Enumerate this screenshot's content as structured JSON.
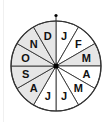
{
  "wheel": {
    "title": "Month wheel",
    "center": [
      56,
      66
    ],
    "radius": 45,
    "shade_color": "#e6e6e6",
    "line_color": "#333333",
    "segments": [
      {
        "label": "J",
        "shaded": false
      },
      {
        "label": "F",
        "shaded": false
      },
      {
        "label": "M",
        "shaded": true
      },
      {
        "label": "A",
        "shaded": false
      },
      {
        "label": "M",
        "shaded": false
      },
      {
        "label": "J",
        "shaded": false
      },
      {
        "label": "J",
        "shaded": false
      },
      {
        "label": "A",
        "shaded": true
      },
      {
        "label": "S",
        "shaded": true
      },
      {
        "label": "O",
        "shaded": true
      },
      {
        "label": "N",
        "shaded": true
      },
      {
        "label": "D",
        "shaded": true
      }
    ]
  }
}
